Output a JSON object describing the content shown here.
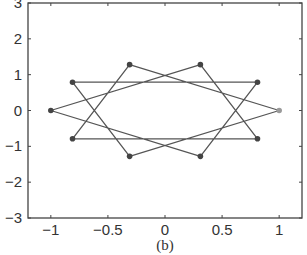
{
  "chart_data": {
    "type": "line",
    "title": "",
    "caption": "(b)",
    "xlabel": "",
    "ylabel": "",
    "xlim": [
      -1.2,
      1.2
    ],
    "ylim": [
      -3,
      3
    ],
    "grid": false,
    "legend": null,
    "xticks": [
      -1,
      -0.5,
      0,
      0.5,
      1
    ],
    "xtick_labels": [
      "−1",
      "−0.5",
      "0",
      "0.5",
      "1"
    ],
    "yticks": [
      -3,
      -2,
      -1,
      0,
      1,
      2,
      3
    ],
    "ytick_labels": [
      "−3",
      "−2",
      "−1",
      "0",
      "1",
      "2",
      "3"
    ],
    "series": [
      {
        "name": "star-polygon",
        "marker": "filled-circle",
        "line_color": "#555555",
        "marker_color": "#444444",
        "x": [
          1.0,
          -0.31,
          -0.81,
          0.81,
          0.31,
          -1.0,
          0.31,
          0.81,
          -0.81,
          -0.31,
          1.0
        ],
        "y": [
          0.0,
          1.28,
          -0.79,
          -0.79,
          1.28,
          0.0,
          -1.28,
          0.79,
          0.79,
          -1.28,
          0.0
        ]
      }
    ],
    "vertices": [
      {
        "x": 1.0,
        "y": 0.0,
        "color": "#9a9a9a"
      },
      {
        "x": 0.81,
        "y": 0.79,
        "color": "#444444"
      },
      {
        "x": 0.31,
        "y": 1.28,
        "color": "#444444"
      },
      {
        "x": -0.31,
        "y": 1.28,
        "color": "#444444"
      },
      {
        "x": -0.81,
        "y": 0.79,
        "color": "#444444"
      },
      {
        "x": -1.0,
        "y": 0.0,
        "color": "#444444"
      },
      {
        "x": -0.81,
        "y": -0.79,
        "color": "#444444"
      },
      {
        "x": -0.31,
        "y": -1.28,
        "color": "#444444"
      },
      {
        "x": 0.31,
        "y": -1.28,
        "color": "#444444"
      },
      {
        "x": 0.81,
        "y": -0.79,
        "color": "#444444"
      }
    ]
  },
  "layout": {
    "plot_left": 28,
    "plot_right": 302,
    "plot_top": 3,
    "plot_bottom": 218
  }
}
